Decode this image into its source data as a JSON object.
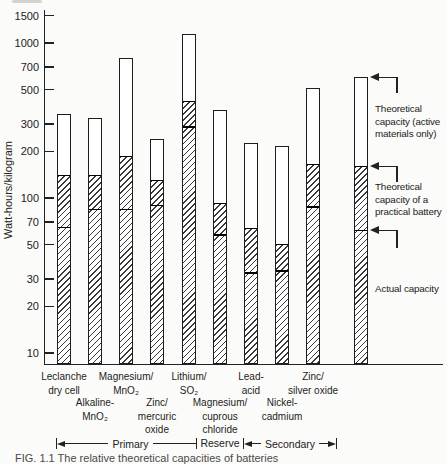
{
  "figure": {
    "background": "#fbfbf9",
    "ink_color": "#222222"
  },
  "chart_data": {
    "type": "bar",
    "subtype": "stacked-range-log",
    "title": "",
    "xlabel": "",
    "ylabel": "Watt-hours/kilogram",
    "y_scale": "log",
    "ylim": [
      10,
      1500
    ],
    "yticks": [
      10,
      20,
      30,
      50,
      70,
      100,
      200,
      300,
      500,
      700,
      1000,
      1500
    ],
    "grid": false,
    "segment_meanings": {
      "top_white": "Theoretical capacity (active materials only)",
      "hatched_upper_boundary": "Theoretical capacity of a practical battery",
      "inner_line": "Actual capacity"
    },
    "bars": [
      {
        "label_lines": [
          "Leclanche",
          "dry cell"
        ],
        "label_row": "upper",
        "group": "Primary",
        "theoretical": 350,
        "practical": 140,
        "actual": 65
      },
      {
        "label_lines": [
          "Alkaline-",
          "MnO₂"
        ],
        "label_row": "lower",
        "group": "Primary",
        "theoretical": 330,
        "practical": 140,
        "actual": 85
      },
      {
        "label_lines": [
          "Magnesium/",
          "MnO₂"
        ],
        "label_row": "upper",
        "group": "Primary",
        "theoretical": 800,
        "practical": 185,
        "actual": 85
      },
      {
        "label_lines": [
          "Zinc/",
          "mercuric",
          "oxide"
        ],
        "label_row": "lower",
        "group": "Primary",
        "theoretical": 240,
        "practical": 130,
        "actual": 90
      },
      {
        "label_lines": [
          "Lithium/",
          "SO₂"
        ],
        "label_row": "upper",
        "group": "Primary",
        "theoretical": 1150,
        "practical": 420,
        "actual": 290
      },
      {
        "label_lines": [
          "Magnesium/",
          "cuprous",
          "chloride"
        ],
        "label_row": "lower",
        "group": "Reserve",
        "theoretical": 370,
        "practical": 92,
        "actual": 58
      },
      {
        "label_lines": [
          "Lead-",
          "acid"
        ],
        "label_row": "upper",
        "group": "Secondary",
        "theoretical": 225,
        "practical": 64,
        "actual": 33
      },
      {
        "label_lines": [
          "Nickel-",
          "cadmium"
        ],
        "label_row": "lower",
        "group": "Secondary",
        "theoretical": 215,
        "practical": 50,
        "actual": 34
      },
      {
        "label_lines": [
          "Zinc/",
          "silver oxide"
        ],
        "label_row": "upper",
        "group": "Secondary",
        "theoretical": 510,
        "practical": 165,
        "actual": 88
      },
      {
        "label_lines": [],
        "label_row": null,
        "group": null,
        "role": "example-bar",
        "theoretical": 600,
        "practical": 160,
        "actual": 62
      }
    ],
    "group_spans": [
      {
        "label": "Primary",
        "bars": [
          0,
          1,
          2,
          3,
          4
        ],
        "style": "left-arrow"
      },
      {
        "label": "Reserve",
        "bars": [
          5
        ],
        "style": "text-only"
      },
      {
        "label": "Secondary",
        "bars": [
          6,
          7,
          8
        ],
        "style": "double-arrow"
      }
    ],
    "legend_position": "right-of-plot"
  },
  "annotations": {
    "theoretical_active": {
      "lines": [
        "Theoretical",
        "capacity (active",
        "materials only)"
      ],
      "points_to": "top of example bar"
    },
    "theoretical_practical": {
      "lines": [
        "Theoretical",
        "capacity of a",
        "practical battery"
      ],
      "points_to": "top of hatched section of example bar"
    },
    "actual": {
      "lines": [
        "Actual capacity"
      ],
      "points_to": "inner boundary line of example bar"
    }
  },
  "caption_clipped": {
    "text": "FIG. 1.1   The relative theoretical capacities of batteries"
  }
}
